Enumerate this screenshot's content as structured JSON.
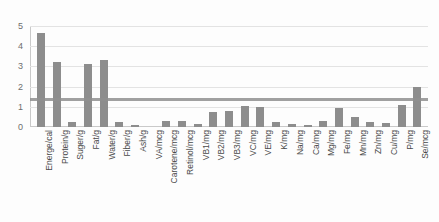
{
  "chart_data": {
    "type": "bar",
    "title": "",
    "subtitle": "",
    "xlabel": "",
    "ylabel": "",
    "ylim": [
      0,
      5
    ],
    "yticks": [
      0,
      1,
      2,
      3,
      4,
      5
    ],
    "grid": true,
    "legend": "none",
    "orientation": "vertical",
    "bar_color": "#8d8d8d",
    "categories": [
      "Energe/cal",
      "Protein/g",
      "Suger/g",
      "Fat/g",
      "Water/g",
      "Fiber/g",
      "Ash/g",
      "VA/mcg",
      "Carotene/mcg",
      "Retinol/mcg",
      "VB1/mg",
      "VB2/mg",
      "VB3/mg",
      "VC/mg",
      "VE/mg",
      "K/mg",
      "Na/mg",
      "Ca/mg",
      "Mg/mg",
      "Fe/mg",
      "Mn/mg",
      "Zn/mg",
      "Cu/mg",
      "P/mg",
      "Se/mcg"
    ],
    "values": [
      4.65,
      3.2,
      0.25,
      3.1,
      3.3,
      0.25,
      0.1,
      0,
      0.3,
      0.3,
      0.15,
      0.75,
      0.8,
      1.05,
      1.0,
      0.25,
      0.15,
      0.12,
      0.3,
      0.95,
      0.5,
      0.25,
      0.2,
      1.1,
      2.0
    ],
    "annotations": [
      {
        "name": "horizontal-reference-line",
        "value": 1.3,
        "color": "#8f8f8f"
      }
    ]
  }
}
